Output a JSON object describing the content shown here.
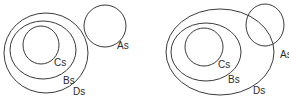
{
  "diagrams": [
    {
      "name": "left-venn",
      "sets": [
        {
          "label": "Ds",
          "cx": 46,
          "cy": 53,
          "rx": 42,
          "ry": 40,
          "lx": 73,
          "ly": 95
        },
        {
          "label": "Bs",
          "cx": 43,
          "cy": 50,
          "rx": 33,
          "ry": 29,
          "lx": 63,
          "ly": 84
        },
        {
          "label": "Cs",
          "cx": 41,
          "cy": 45,
          "rx": 18,
          "ry": 19,
          "lx": 54,
          "ly": 66
        },
        {
          "label": "As",
          "cx": 105,
          "cy": 26,
          "rx": 21,
          "ry": 21,
          "lx": 117,
          "ly": 49
        }
      ]
    },
    {
      "name": "right-venn",
      "sets": [
        {
          "label": "Ds",
          "cx": 220,
          "cy": 52,
          "rx": 54,
          "ry": 43,
          "lx": 253,
          "ly": 94
        },
        {
          "label": "Bs",
          "cx": 206,
          "cy": 52,
          "rx": 35,
          "ry": 29,
          "lx": 228,
          "ly": 83
        },
        {
          "label": "Cs",
          "cx": 204,
          "cy": 47,
          "rx": 19,
          "ry": 19,
          "lx": 218,
          "ly": 68
        },
        {
          "label": "As",
          "cx": 265,
          "cy": 25,
          "rx": 19,
          "ry": 21,
          "lx": 280,
          "ly": 58
        }
      ]
    }
  ]
}
